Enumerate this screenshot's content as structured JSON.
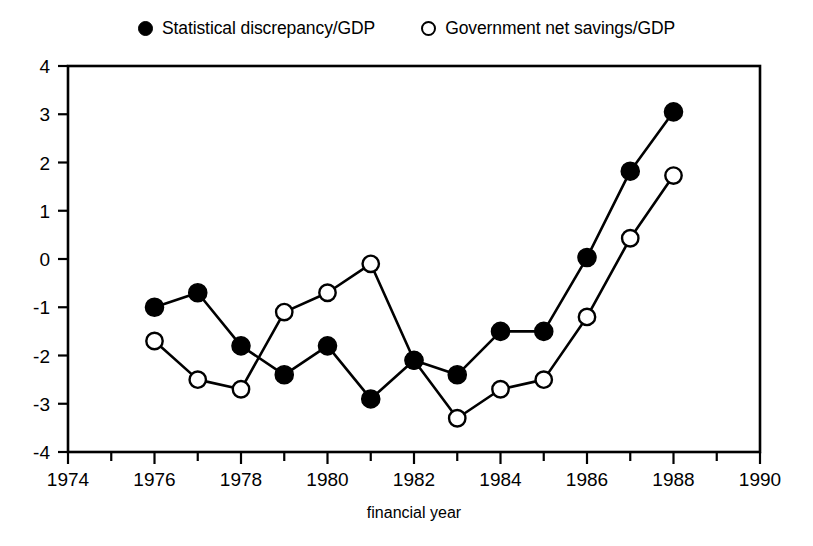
{
  "legend": {
    "entries": [
      {
        "label": "Statistical discrepancy/GDP",
        "marker": "filled-circle-icon"
      },
      {
        "label": "Government net savings/GDP",
        "marker": "open-circle-icon"
      }
    ]
  },
  "axes": {
    "x_title": "financial year",
    "y_title": "",
    "x_ticks": [
      "1974",
      "1976",
      "1978",
      "1980",
      "1982",
      "1984",
      "1986",
      "1988",
      "1990"
    ],
    "y_ticks": [
      "4",
      "3",
      "2",
      "1",
      "0",
      "-1",
      "-2",
      "-3",
      "-4"
    ]
  },
  "chart_data": {
    "type": "line",
    "title": "",
    "subtitle": "",
    "xlabel": "financial year",
    "ylabel": "",
    "xlim": [
      1974,
      1990
    ],
    "ylim": [
      -4,
      4
    ],
    "x_tick_step": 2,
    "x_minor_tick_step": 1,
    "y_tick_step": 1,
    "grid": false,
    "legend_position": "top-center",
    "x": [
      1976,
      1977,
      1978,
      1979,
      1980,
      1981,
      1982,
      1983,
      1984,
      1985,
      1986,
      1987,
      1988
    ],
    "series": [
      {
        "name": "Statistical discrepancy/GDP",
        "marker": "filled-circle",
        "color": "#000000",
        "values": [
          -1.0,
          -0.7,
          -1.8,
          -2.4,
          -1.8,
          -2.9,
          -2.1,
          -2.4,
          -1.5,
          -1.5,
          0.03,
          1.82,
          3.05
        ]
      },
      {
        "name": "Government net savings/GDP",
        "marker": "open-circle",
        "color": "#000000",
        "values": [
          -1.7,
          -2.5,
          -2.7,
          -1.1,
          -0.7,
          -0.1,
          -2.1,
          -3.3,
          -2.7,
          -2.5,
          -1.2,
          0.43,
          1.73
        ]
      }
    ]
  }
}
